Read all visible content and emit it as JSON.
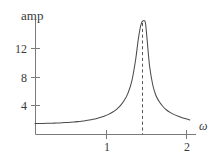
{
  "figure": {
    "title": "",
    "background_color": "#ffffff",
    "stroke_color": "#4a4a4a",
    "axis_color": "#6b6b6b",
    "text_color": "#3a3a3a"
  },
  "labels": {
    "y_axis_title": "amp",
    "x_axis_title": "ω"
  },
  "chart_data": {
    "type": "line",
    "title": "",
    "subtitle": "",
    "xlabel": "ω",
    "ylabel": "amp",
    "xlim": [
      0,
      2.08
    ],
    "ylim": [
      0,
      15.2
    ],
    "grid": false,
    "legend": null,
    "x_ticks": [
      1,
      2
    ],
    "x_tick_labels": [
      "1",
      "2"
    ],
    "y_ticks": [
      4,
      8,
      12
    ],
    "y_tick_labels": [
      "4",
      "8",
      "12"
    ],
    "annotations": [
      {
        "name": "resonance-asymptote",
        "type": "vline",
        "x": 1.41,
        "style": "dashed",
        "label": ""
      }
    ],
    "series": [
      {
        "name": "amplitude",
        "style": "solid",
        "x": [
          0.0,
          0.05,
          0.1,
          0.15,
          0.2,
          0.25,
          0.3,
          0.35,
          0.4,
          0.45,
          0.5,
          0.55,
          0.6,
          0.65,
          0.7,
          0.75,
          0.8,
          0.85,
          0.9,
          0.95,
          1.0,
          1.05,
          1.1,
          1.15,
          1.2,
          1.25,
          1.3,
          1.33,
          1.36,
          1.38,
          1.39,
          1.4,
          1.405,
          1.41,
          1.415,
          1.42,
          1.43,
          1.45,
          1.48,
          1.52,
          1.56,
          1.6,
          1.65,
          1.7,
          1.75,
          1.8,
          1.85,
          1.9,
          1.95,
          2.0
        ],
        "y": [
          1.4,
          1.4,
          1.41,
          1.42,
          1.43,
          1.45,
          1.47,
          1.49,
          1.52,
          1.56,
          1.6,
          1.65,
          1.71,
          1.78,
          1.86,
          1.96,
          2.08,
          2.22,
          2.4,
          2.62,
          2.9,
          3.26,
          3.74,
          4.42,
          5.42,
          7.02,
          9.9,
          12.3,
          14.2,
          14.9,
          15.05,
          15.1,
          15.1,
          15.1,
          15.1,
          15.05,
          14.6,
          12.4,
          9.1,
          6.6,
          5.2,
          4.4,
          3.7,
          3.2,
          2.85,
          2.58,
          2.36,
          2.18,
          2.02,
          1.88
        ]
      }
    ]
  },
  "geometry": {
    "plot_left_px": 35,
    "plot_right_px": 196,
    "plot_bottom_px": 134,
    "plot_top_px": 20
  }
}
